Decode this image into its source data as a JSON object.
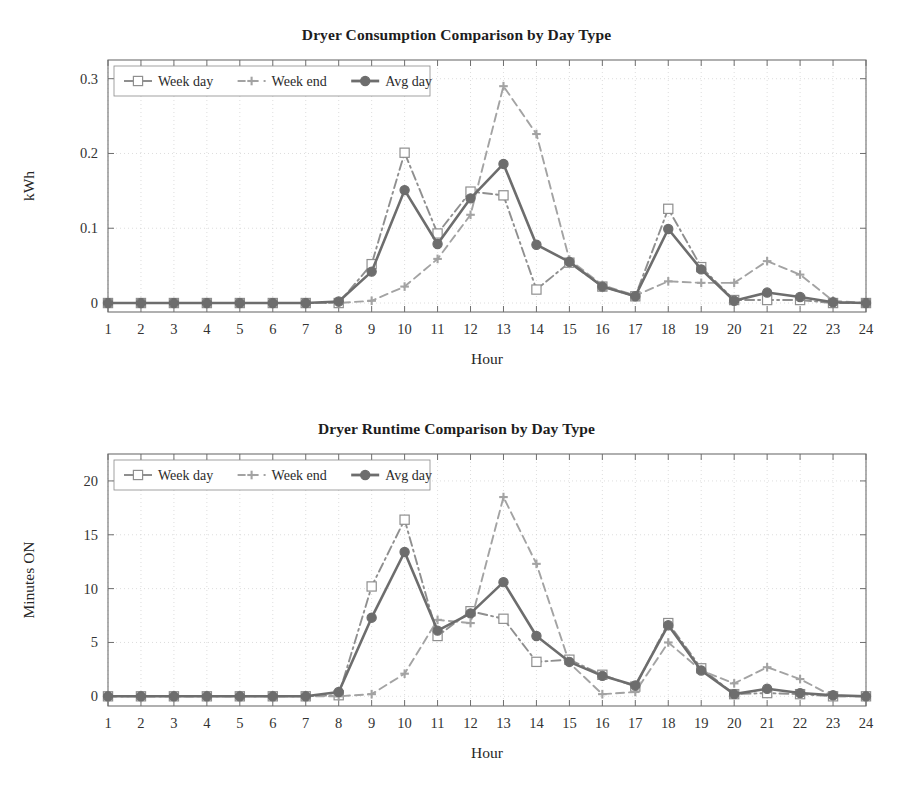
{
  "figure": {
    "background": "#ffffff",
    "width": 913,
    "height": 794
  },
  "colors": {
    "week_day": "#8f8f8f",
    "week_end": "#a3a3a3",
    "avg_day": "#6d6d6d",
    "axis": "#6f6f6f",
    "grid": "#cfcfcf",
    "text": "#2b2b2b"
  },
  "panels": [
    {
      "id": "consumption",
      "title": "Dryer Consumption Comparison by Day Type",
      "xlabel": "Hour",
      "ylabel": "kWh",
      "legend": [
        {
          "label": "Week day",
          "marker": "square",
          "dash": "dashdot"
        },
        {
          "label": "Week end",
          "marker": "plus",
          "dash": "dashed"
        },
        {
          "label": "Avg day",
          "marker": "circle",
          "dash": "solid"
        }
      ]
    },
    {
      "id": "runtime",
      "title": "Dryer Runtime Comparison by Day Type",
      "xlabel": "Hour",
      "ylabel": "Minutes ON",
      "legend": [
        {
          "label": "Week day",
          "marker": "square",
          "dash": "dashdot"
        },
        {
          "label": "Week end",
          "marker": "plus",
          "dash": "dashed"
        },
        {
          "label": "Avg day",
          "marker": "circle",
          "dash": "solid"
        }
      ]
    }
  ],
  "chart_data": [
    {
      "type": "line",
      "id": "consumption",
      "title": "Dryer Consumption Comparison by Day Type",
      "xlabel": "Hour",
      "ylabel": "kWh",
      "x": [
        1,
        2,
        3,
        4,
        5,
        6,
        7,
        8,
        9,
        10,
        11,
        12,
        13,
        14,
        15,
        16,
        17,
        18,
        19,
        20,
        21,
        22,
        23,
        24
      ],
      "xticklabels": [
        "1",
        "2",
        "3",
        "4",
        "5",
        "6",
        "7",
        "8",
        "9",
        "10",
        "11",
        "12",
        "13",
        "14",
        "15",
        "16",
        "17",
        "18",
        "19",
        "20",
        "21",
        "22",
        "23",
        "24"
      ],
      "yticks": [
        0,
        0.1,
        0.2,
        0.3
      ],
      "yticklabels": [
        "0",
        "0.1",
        "0.2",
        "0.3"
      ],
      "xlim": [
        1,
        24
      ],
      "ylim": [
        -0.012,
        0.325
      ],
      "grid": true,
      "legend_position": "upper-left",
      "series": [
        {
          "name": "Week day",
          "marker": "square",
          "dash": "dashdot",
          "color": "#8f8f8f",
          "values": [
            0,
            0,
            0,
            0,
            0,
            0,
            0,
            0,
            0.052,
            0.201,
            0.093,
            0.149,
            0.144,
            0.018,
            0.054,
            0.022,
            0.009,
            0.126,
            0.048,
            0.004,
            0.004,
            0.004,
            0,
            0
          ]
        },
        {
          "name": "Week end",
          "marker": "plus",
          "dash": "dashed",
          "color": "#a3a3a3",
          "values": [
            0,
            0,
            0,
            0,
            0,
            0,
            0,
            0,
            0.003,
            0.022,
            0.059,
            0.118,
            0.29,
            0.226,
            0.058,
            0.024,
            0.01,
            0.029,
            0.027,
            0.027,
            0.056,
            0.038,
            0.003,
            0
          ]
        },
        {
          "name": "Avg day",
          "marker": "circle",
          "dash": "solid",
          "color": "#6d6d6d",
          "values": [
            0,
            0,
            0,
            0,
            0,
            0,
            0,
            0.002,
            0.042,
            0.151,
            0.079,
            0.14,
            0.186,
            0.078,
            0.055,
            0.022,
            0.009,
            0.099,
            0.045,
            0.003,
            0.014,
            0.008,
            0.001,
            0
          ]
        }
      ]
    },
    {
      "type": "line",
      "id": "runtime",
      "title": "Dryer Runtime Comparison by Day Type",
      "xlabel": "Hour",
      "ylabel": "Minutes ON",
      "x": [
        1,
        2,
        3,
        4,
        5,
        6,
        7,
        8,
        9,
        10,
        11,
        12,
        13,
        14,
        15,
        16,
        17,
        18,
        19,
        20,
        21,
        22,
        23,
        24
      ],
      "xticklabels": [
        "1",
        "2",
        "3",
        "4",
        "5",
        "6",
        "7",
        "8",
        "9",
        "10",
        "11",
        "12",
        "13",
        "14",
        "15",
        "16",
        "17",
        "18",
        "19",
        "20",
        "21",
        "22",
        "23",
        "24"
      ],
      "yticks": [
        0,
        5,
        10,
        15,
        20
      ],
      "yticklabels": [
        "0",
        "5",
        "10",
        "15",
        "20"
      ],
      "xlim": [
        1,
        24
      ],
      "ylim": [
        -0.9,
        22.5
      ],
      "grid": true,
      "legend_position": "upper-left",
      "series": [
        {
          "name": "Week day",
          "marker": "square",
          "dash": "dashdot",
          "color": "#8f8f8f",
          "values": [
            0,
            0,
            0,
            0,
            0,
            0,
            0,
            0.1,
            10.2,
            16.4,
            5.6,
            7.9,
            7.2,
            3.2,
            3.4,
            2.0,
            0.9,
            6.8,
            2.6,
            0.2,
            0.3,
            0.2,
            0,
            0
          ]
        },
        {
          "name": "Week end",
          "marker": "plus",
          "dash": "dashed",
          "color": "#a3a3a3",
          "values": [
            0,
            0,
            0,
            0,
            0,
            0,
            0,
            0,
            0.2,
            2.1,
            7.1,
            6.8,
            18.5,
            12.3,
            3.1,
            0.2,
            0.4,
            5.0,
            2.4,
            1.2,
            2.7,
            1.6,
            0,
            0
          ]
        },
        {
          "name": "Avg day",
          "marker": "circle",
          "dash": "solid",
          "color": "#6d6d6d",
          "values": [
            0,
            0,
            0,
            0,
            0,
            0,
            0,
            0.4,
            7.3,
            13.4,
            6.1,
            7.7,
            10.6,
            5.6,
            3.2,
            1.9,
            1.0,
            6.6,
            2.4,
            0.2,
            0.7,
            0.3,
            0.1,
            0
          ]
        }
      ]
    }
  ]
}
